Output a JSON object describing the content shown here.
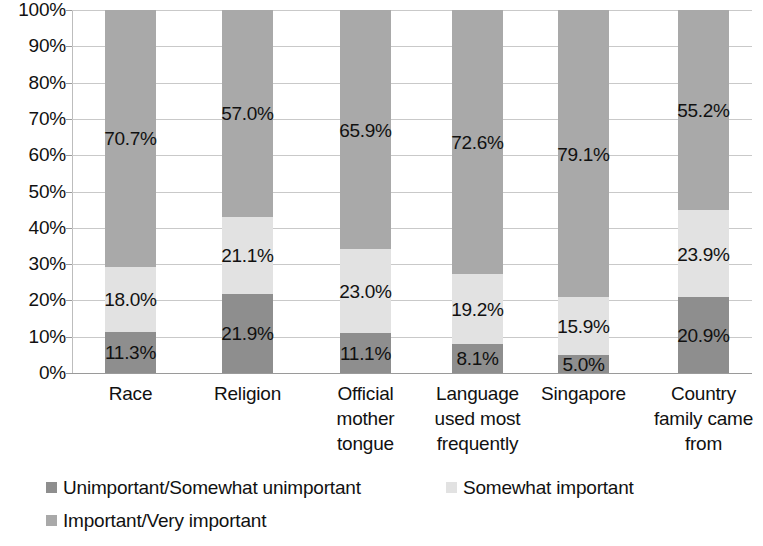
{
  "chart_data": {
    "type": "bar",
    "subtype": "stacked-percentage",
    "title": "",
    "xlabel": "",
    "ylabel": "",
    "ylim": [
      0,
      100
    ],
    "grid": true,
    "legend_position": "bottom-left",
    "y_ticks": [
      "100%",
      "90%",
      "80%",
      "70%",
      "60%",
      "50%",
      "40%",
      "30%",
      "20%",
      "10%",
      "0%"
    ],
    "y_tick_values": [
      100,
      90,
      80,
      70,
      60,
      50,
      40,
      30,
      20,
      10,
      0
    ],
    "categories": [
      "Race",
      "Religion",
      "Official mother tongue",
      "Language used most frequently",
      "Singapore",
      "Country family came from"
    ],
    "category_lines": [
      [
        "Race"
      ],
      [
        "Religion"
      ],
      [
        "Official",
        "mother",
        "tongue"
      ],
      [
        "Language",
        "used most",
        "frequently"
      ],
      [
        "Singapore"
      ],
      [
        "Country",
        "family came",
        "from"
      ]
    ],
    "series": [
      {
        "name": "Unimportant/Somewhat unimportant",
        "color": "#8e8e8e",
        "values": [
          11.3,
          21.9,
          11.1,
          8.1,
          5.0,
          20.9
        ],
        "labels": [
          "11.3%",
          "21.9%",
          "11.1%",
          "8.1%",
          "5.0%",
          "20.9%"
        ]
      },
      {
        "name": "Somewhat important",
        "color": "#e2e2e2",
        "values": [
          18.0,
          21.1,
          23.0,
          19.2,
          15.9,
          23.9
        ],
        "labels": [
          "18.0%",
          "21.1%",
          "23.0%",
          "19.2%",
          "15.9%",
          "23.9%"
        ]
      },
      {
        "name": "Important/Very important",
        "color": "#a9a9a9",
        "values": [
          70.7,
          57.0,
          65.9,
          72.6,
          79.1,
          55.2
        ],
        "labels": [
          "70.7%",
          "57.0%",
          "65.9%",
          "72.6%",
          "79.1%",
          "55.2%"
        ]
      }
    ]
  },
  "legend": {
    "items": [
      {
        "label": "Unimportant/Somewhat unimportant",
        "color": "#8e8e8e"
      },
      {
        "label": "Somewhat important",
        "color": "#e2e2e2"
      },
      {
        "label": "Important/Very important",
        "color": "#a9a9a9"
      }
    ]
  }
}
